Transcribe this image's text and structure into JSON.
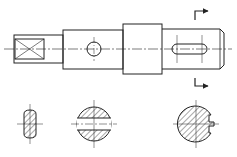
{
  "drawing": {
    "title": "Shaft with sections",
    "colors": {
      "line": "#222222",
      "background": "#ffffff"
    },
    "main_view": {
      "centerline_y": 49,
      "segments": [
        {
          "name": "left-square-end",
          "x": 14,
          "y": 35,
          "w": 49,
          "h": 28
        },
        {
          "name": "middle-shaft",
          "x": 63,
          "y": 30,
          "w": 60,
          "h": 39
        },
        {
          "name": "collar",
          "x": 123,
          "y": 24,
          "w": 39,
          "h": 50
        },
        {
          "name": "right-shaft",
          "x": 162,
          "y": 29,
          "w": 62,
          "h": 40
        }
      ],
      "square_flat": {
        "x": 15,
        "y": 39,
        "w": 29,
        "h": 20
      },
      "cross_hole": {
        "cx": 94,
        "cy": 49,
        "r": 7
      },
      "keyway_slot": {
        "x": 172,
        "y": 44,
        "w": 35,
        "h": 10
      }
    },
    "section_marks": {
      "x": 195,
      "top_y": 10,
      "bottom_y": 87
    },
    "sections": [
      {
        "name": "section-square",
        "cx": 30,
        "cy": 124
      },
      {
        "name": "section-cross-hole",
        "cx": 94,
        "cy": 124,
        "r": 17
      },
      {
        "name": "section-keyway",
        "cx": 196,
        "cy": 124,
        "r": 18
      }
    ]
  }
}
